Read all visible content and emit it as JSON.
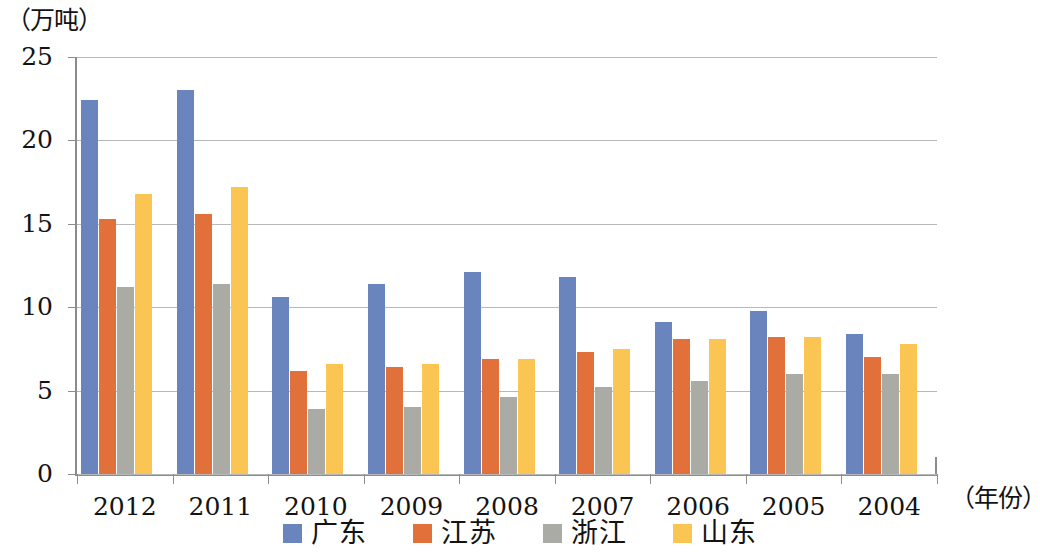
{
  "chart_data": {
    "type": "bar",
    "title": "",
    "subtitle": "",
    "xlabel": "（年份）",
    "ylabel": "（万吨）",
    "categories": [
      "2012",
      "2011",
      "2010",
      "2009",
      "2008",
      "2007",
      "2006",
      "2005",
      "2004"
    ],
    "ylim": [
      0,
      25
    ],
    "yticks": [
      "0",
      "5",
      "10",
      "15",
      "20",
      "25"
    ],
    "ytick_values": [
      0,
      5,
      10,
      15,
      20,
      25
    ],
    "grid": true,
    "legend_position": "bottom",
    "series": [
      {
        "name": "广东",
        "color": "#6A84BE",
        "values": [
          22.4,
          23.0,
          10.6,
          11.4,
          12.1,
          11.8,
          9.1,
          9.8,
          8.4
        ]
      },
      {
        "name": "江苏",
        "color": "#E1703A",
        "values": [
          15.3,
          15.6,
          6.2,
          6.4,
          6.9,
          7.3,
          8.1,
          8.2,
          7.0
        ]
      },
      {
        "name": "浙江",
        "color": "#ABABA6",
        "values": [
          11.2,
          11.4,
          3.9,
          4.0,
          4.6,
          5.2,
          5.6,
          6.0,
          6.0
        ]
      },
      {
        "name": "山东",
        "color": "#FAC552",
        "values": [
          16.8,
          17.2,
          6.6,
          6.6,
          6.9,
          7.5,
          8.1,
          8.2,
          7.8
        ]
      }
    ]
  },
  "legend": {
    "items": [
      {
        "label": "广东",
        "color": "#6A84BE"
      },
      {
        "label": "江苏",
        "color": "#E1703A"
      },
      {
        "label": "浙江",
        "color": "#ABABA6"
      },
      {
        "label": "山东",
        "color": "#FAC552"
      }
    ]
  }
}
